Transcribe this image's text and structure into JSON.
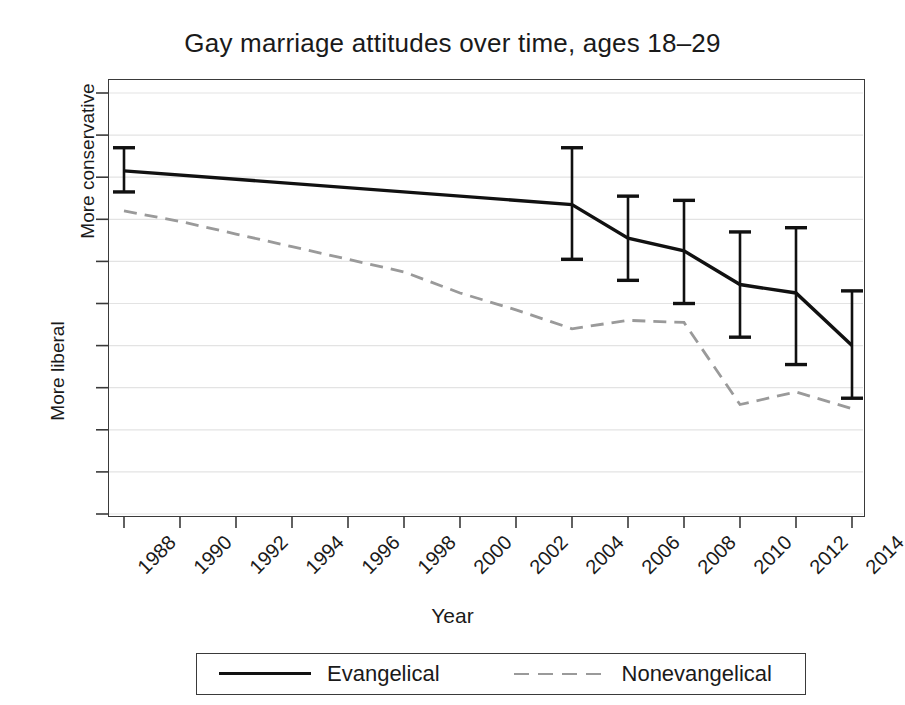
{
  "chart_data": {
    "type": "line",
    "title": "Gay marriage attitudes over time, ages 18–29",
    "xlabel": "Year",
    "ylabel_top": "More conservative",
    "ylabel_bottom": "More liberal",
    "xlim": [
      1988,
      2014
    ],
    "ylim": [
      0,
      1
    ],
    "x_ticks": [
      1988,
      1990,
      1992,
      1994,
      1996,
      1998,
      2000,
      2002,
      2004,
      2006,
      2008,
      2010,
      2012,
      2014
    ],
    "y_ticks": [
      "0",
      ".1",
      ".2",
      ".3",
      ".4",
      ".5",
      ".6",
      ".7",
      ".8",
      ".9",
      "1"
    ],
    "y_tick_values": [
      0,
      0.1,
      0.2,
      0.3,
      0.4,
      0.5,
      0.6,
      0.7,
      0.8,
      0.9,
      1
    ],
    "grid": true,
    "legend_position": "below-axis",
    "series": [
      {
        "name": "Evangelical",
        "style": "solid",
        "color": "#111111",
        "x": [
          1988,
          2004,
          2006,
          2008,
          2010,
          2012,
          2014
        ],
        "values": [
          0.815,
          0.735,
          0.655,
          0.625,
          0.545,
          0.525,
          0.4
        ],
        "error_low": [
          0.765,
          0.605,
          0.555,
          0.5,
          0.42,
          0.355,
          0.275
        ],
        "error_high": [
          0.87,
          0.87,
          0.755,
          0.745,
          0.67,
          0.68,
          0.53
        ]
      },
      {
        "name": "Nonevangelical",
        "style": "dashed",
        "color": "#9a9a9a",
        "x": [
          1988,
          1990,
          1992,
          1994,
          1996,
          1998,
          2000,
          2002,
          2004,
          2006,
          2008,
          2010,
          2012,
          2014
        ],
        "values": [
          0.72,
          0.695,
          0.665,
          0.635,
          0.605,
          0.575,
          0.525,
          0.485,
          0.44,
          0.46,
          0.455,
          0.26,
          0.29,
          0.25
        ]
      }
    ]
  },
  "legend": {
    "entries": [
      {
        "label": "Evangelical"
      },
      {
        "label": "Nonevangelical"
      }
    ]
  }
}
